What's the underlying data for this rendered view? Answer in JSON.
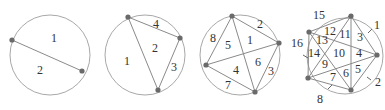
{
  "figures": [
    {
      "id": "n2",
      "circle": {
        "cx": 50,
        "cy": 55,
        "r": 40
      },
      "points": [
        [
          12,
          40
        ],
        [
          82,
          71
        ]
      ],
      "chords": [
        [
          0,
          1
        ]
      ],
      "ticks": [],
      "labels": [
        {
          "text": "1",
          "x": 54,
          "y": 38
        },
        {
          "text": "2",
          "x": 40,
          "y": 70
        }
      ]
    },
    {
      "id": "n3",
      "circle": {
        "cx": 145,
        "cy": 55,
        "r": 40
      },
      "points": [
        [
          128,
          17
        ],
        [
          180,
          38
        ],
        [
          158,
          90
        ]
      ],
      "chords": [
        [
          0,
          1
        ],
        [
          1,
          2
        ],
        [
          2,
          0
        ]
      ],
      "ticks": [],
      "labels": [
        {
          "text": "4",
          "x": 156,
          "y": 24
        },
        {
          "text": "2",
          "x": 155,
          "y": 48
        },
        {
          "text": "1",
          "x": 127,
          "y": 61
        },
        {
          "text": "3",
          "x": 174,
          "y": 67
        }
      ]
    },
    {
      "id": "n4",
      "circle": {
        "cx": 240,
        "cy": 55,
        "r": 40
      },
      "points": [
        [
          232,
          16
        ],
        [
          279,
          43
        ],
        [
          206,
          65
        ],
        [
          255,
          92
        ]
      ],
      "chords": [
        [
          0,
          1
        ],
        [
          0,
          2
        ],
        [
          0,
          3
        ],
        [
          1,
          2
        ],
        [
          1,
          3
        ],
        [
          2,
          3
        ]
      ],
      "ticks": [],
      "labels": [
        {
          "text": "2",
          "x": 260,
          "y": 24
        },
        {
          "text": "1",
          "x": 250,
          "y": 40
        },
        {
          "text": "8",
          "x": 213,
          "y": 38
        },
        {
          "text": "5",
          "x": 228,
          "y": 45
        },
        {
          "text": "6",
          "x": 258,
          "y": 62
        },
        {
          "text": "4",
          "x": 236,
          "y": 70
        },
        {
          "text": "3",
          "x": 271,
          "y": 71
        },
        {
          "text": "7",
          "x": 228,
          "y": 85
        }
      ]
    },
    {
      "id": "n5",
      "circle": {
        "cx": 345,
        "cy": 56,
        "r": 38
      },
      "points": [
        [
          351,
          16
        ],
        [
          377,
          55
        ],
        [
          309,
          32
        ],
        [
          308,
          78
        ],
        [
          351,
          90
        ]
      ],
      "chords": [
        [
          0,
          1
        ],
        [
          0,
          2
        ],
        [
          0,
          3
        ],
        [
          0,
          4
        ],
        [
          1,
          2
        ],
        [
          1,
          3
        ],
        [
          1,
          4
        ],
        [
          2,
          3
        ],
        [
          2,
          4
        ],
        [
          3,
          4
        ]
      ],
      "ticks": [
        {
          "x1": 348,
          "y1": 17,
          "x2": 353,
          "y2": 15,
          "ref": "15",
          "tx": 347,
          "ty": 13
        },
        {
          "x1": 368,
          "y1": 33,
          "x2": 372,
          "y2": 29
        },
        {
          "x1": 367,
          "y1": 77,
          "x2": 371,
          "y2": 80
        },
        {
          "x1": 328,
          "y1": 89,
          "x2": 332,
          "y2": 85
        },
        {
          "x1": 303,
          "y1": 55,
          "x2": 308,
          "y2": 58
        }
      ],
      "labels": [
        {
          "text": "15",
          "x": 319,
          "y": 15
        },
        {
          "text": "1",
          "x": 377,
          "y": 25
        },
        {
          "text": "12",
          "x": 330,
          "y": 31
        },
        {
          "text": "11",
          "x": 345,
          "y": 34
        },
        {
          "text": "3",
          "x": 360,
          "y": 37
        },
        {
          "text": "16",
          "x": 297,
          "y": 43
        },
        {
          "text": "13",
          "x": 322,
          "y": 40
        },
        {
          "text": "14",
          "x": 314,
          "y": 53
        },
        {
          "text": "10",
          "x": 339,
          "y": 53
        },
        {
          "text": "4",
          "x": 359,
          "y": 53
        },
        {
          "text": "9",
          "x": 325,
          "y": 64
        },
        {
          "text": "6",
          "x": 346,
          "y": 73
        },
        {
          "text": "5",
          "x": 358,
          "y": 69
        },
        {
          "text": "7",
          "x": 333,
          "y": 77
        },
        {
          "text": "2",
          "x": 378,
          "y": 82
        },
        {
          "text": "8",
          "x": 320,
          "y": 99
        }
      ]
    }
  ]
}
